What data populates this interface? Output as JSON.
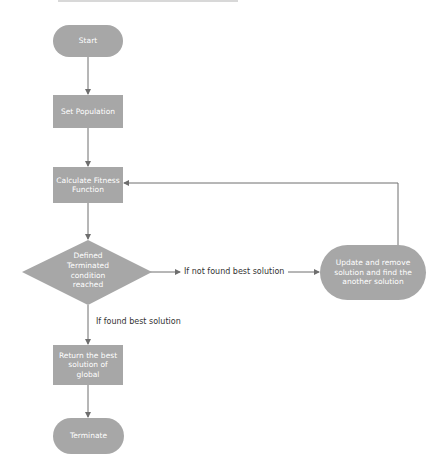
{
  "diagram": {
    "type": "flowchart",
    "nodes": {
      "start": {
        "label": "Start",
        "shape": "terminator"
      },
      "set_population": {
        "label": "Set Population",
        "shape": "process"
      },
      "calculate_fitness": {
        "label": "Calculate Fitness Function",
        "shape": "process"
      },
      "decision": {
        "label": "Defined Terminated condition reached",
        "lines": [
          "Defined",
          "Terminated",
          "condition",
          "reached"
        ],
        "shape": "decision"
      },
      "update": {
        "label": "Update and remove solution and find the another solution",
        "shape": "terminator"
      },
      "return_best": {
        "label": "Return the best solution of global",
        "shape": "process"
      },
      "terminate": {
        "label": "Terminate",
        "shape": "terminator"
      }
    },
    "edges": {
      "not_found": {
        "label": "If not found best solution"
      },
      "found": {
        "label": "If found best solution"
      }
    },
    "colors": {
      "node_fill": "#a7a7a7",
      "node_text": "#ffffff",
      "line": "#6e6e6e",
      "edge_text": "#333333"
    }
  }
}
